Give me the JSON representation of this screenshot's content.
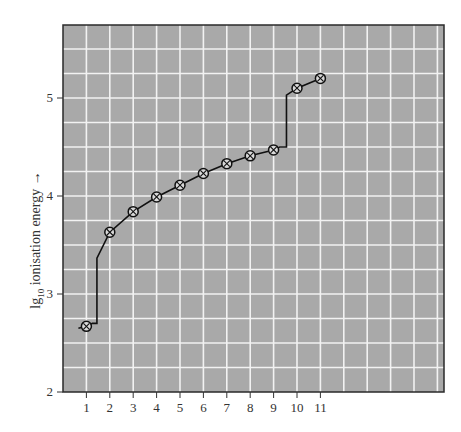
{
  "chart_data": {
    "type": "line",
    "title": "",
    "xlabel": "",
    "ylabel": "lg10 ionisation energy →",
    "ylabel_parts": {
      "prefix": "lg",
      "subscript": "10",
      "suffix": " ionisation energy →"
    },
    "x": [
      1,
      2,
      3,
      4,
      5,
      6,
      7,
      8,
      9,
      10,
      11
    ],
    "values": [
      2.67,
      3.63,
      3.84,
      3.99,
      4.11,
      4.23,
      4.33,
      4.41,
      4.47,
      5.1,
      5.2
    ],
    "x_ticks": [
      "1",
      "2",
      "3",
      "4",
      "5",
      "6",
      "7",
      "8",
      "9",
      "10",
      "11"
    ],
    "y_ticks": [
      "2",
      "3",
      "4",
      "5"
    ],
    "xlim": [
      0,
      16.3
    ],
    "ylim": [
      2,
      5.73
    ],
    "grid": true,
    "legend": null,
    "marker": "circle-cross",
    "steps": [
      {
        "between": [
          1,
          2
        ],
        "at_x": 1.45
      },
      {
        "between": [
          9,
          10
        ],
        "at_x": 9.55
      }
    ],
    "colors": {
      "plot_bg": "#a9a9a9",
      "grid": "#f2f2f2",
      "line": "#111111",
      "frame": "#222222"
    }
  }
}
